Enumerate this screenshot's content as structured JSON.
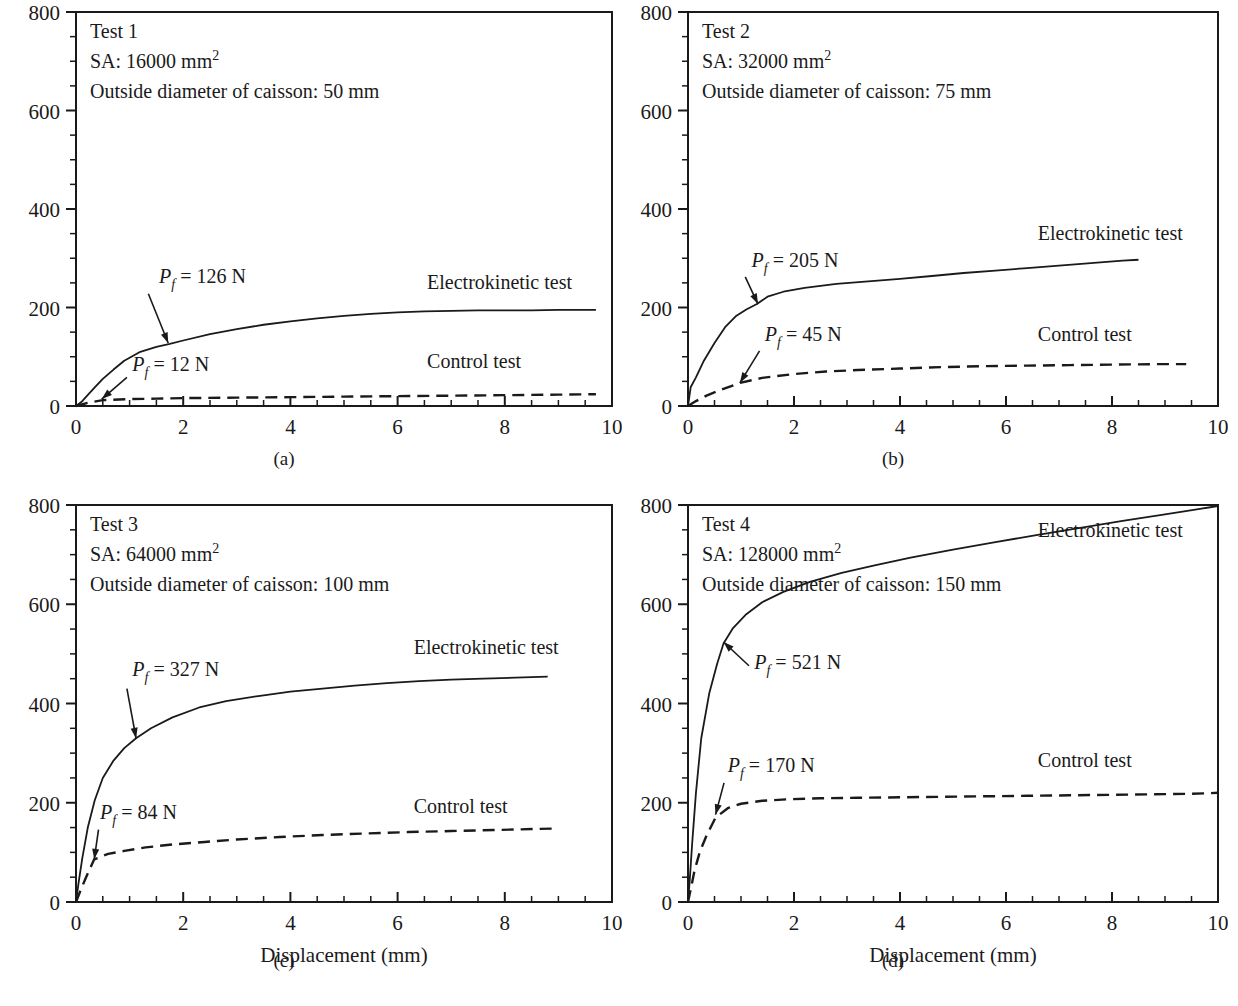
{
  "figure": {
    "axis_titles": {
      "x": "Displacement (mm)",
      "y_prefix": "P",
      "y_suffix": " (N)"
    },
    "x_ticks": [
      "0",
      "2",
      "4",
      "6",
      "8",
      "10"
    ],
    "y_ticks": [
      "0",
      "200",
      "400",
      "600",
      "800"
    ],
    "series_labels": {
      "electrokinetic": "Electrokinetic test",
      "control": "Control test"
    },
    "pf_prefix": "P",
    "pf_sub": "f",
    "pf_eq": " = "
  },
  "panels": [
    {
      "key": "a",
      "caption": "(a)",
      "test_label": "Test 1",
      "sa_label": "SA: 16000 mm",
      "sa_sup": "2",
      "diameter_label": "Outside diameter of caisson: 50 mm",
      "show_ylabel": true,
      "show_xlabel": false,
      "annotations": [
        {
          "name": "pf-electrokinetic",
          "value": "126 N",
          "text_x": 1.55,
          "text_y": 250,
          "tip_x": 1.72,
          "tip_y": 128,
          "tail_x": 1.35,
          "tail_y": 228
        },
        {
          "name": "pf-control",
          "value": "12 N",
          "text_x": 1.05,
          "text_y": 72,
          "tip_x": 0.48,
          "tip_y": 14,
          "tail_x": 0.95,
          "tail_y": 58
        }
      ],
      "labels": [
        {
          "name": "electrokinetic-label",
          "series": "electrokinetic",
          "x": 6.55,
          "y": 238
        },
        {
          "name": "control-label",
          "series": "control",
          "x": 6.55,
          "y": 78
        }
      ]
    },
    {
      "key": "b",
      "caption": "(b)",
      "test_label": "Test 2",
      "sa_label": "SA: 32000 mm",
      "sa_sup": "2",
      "diameter_label": "Outside diameter of caisson: 75 mm",
      "show_ylabel": false,
      "show_xlabel": false,
      "annotations": [
        {
          "name": "pf-electrokinetic",
          "value": "205 N",
          "text_x": 1.2,
          "text_y": 283,
          "tip_x": 1.32,
          "tip_y": 207,
          "tail_x": 1.08,
          "tail_y": 262
        },
        {
          "name": "pf-control",
          "value": "45 N",
          "text_x": 1.45,
          "text_y": 131,
          "tip_x": 0.98,
          "tip_y": 47,
          "tail_x": 1.35,
          "tail_y": 112
        }
      ],
      "labels": [
        {
          "name": "electrokinetic-label",
          "series": "electrokinetic",
          "x": 6.6,
          "y": 338
        },
        {
          "name": "control-label",
          "series": "control",
          "x": 6.6,
          "y": 132
        }
      ]
    },
    {
      "key": "c",
      "caption": "(c)",
      "test_label": "Test 3",
      "sa_label": "SA: 64000 mm",
      "sa_sup": "2",
      "diameter_label": "Outside diameter of caisson: 100 mm",
      "show_ylabel": true,
      "show_xlabel": true,
      "annotations": [
        {
          "name": "pf-electrokinetic",
          "value": "327 N",
          "text_x": 1.05,
          "text_y": 455,
          "tip_x": 1.12,
          "tip_y": 330,
          "tail_x": 0.95,
          "tail_y": 430
        },
        {
          "name": "pf-control",
          "value": "84 N",
          "text_x": 0.45,
          "text_y": 168,
          "tip_x": 0.34,
          "tip_y": 86,
          "tail_x": 0.42,
          "tail_y": 146
        }
      ],
      "labels": [
        {
          "name": "electrokinetic-label",
          "series": "electrokinetic",
          "x": 6.3,
          "y": 500
        },
        {
          "name": "control-label",
          "series": "control",
          "x": 6.3,
          "y": 180
        }
      ]
    },
    {
      "key": "d",
      "caption": "(d)",
      "test_label": "Test 4",
      "sa_label": "SA: 128000 mm",
      "sa_sup": "2",
      "diameter_label": "Outside diameter of caisson: 150 mm",
      "show_ylabel": false,
      "show_xlabel": true,
      "annotations": [
        {
          "name": "pf-electrokinetic",
          "value": "521 N",
          "text_x": 1.25,
          "text_y": 470,
          "tip_x": 0.67,
          "tip_y": 524,
          "tail_x": 1.15,
          "tail_y": 476
        },
        {
          "name": "pf-control",
          "value": "170 N",
          "text_x": 0.75,
          "text_y": 262,
          "tip_x": 0.52,
          "tip_y": 176,
          "tail_x": 0.68,
          "tail_y": 240
        }
      ],
      "labels": [
        {
          "name": "electrokinetic-label",
          "series": "electrokinetic",
          "x": 6.6,
          "y": 735
        },
        {
          "name": "control-label",
          "series": "control",
          "x": 6.6,
          "y": 272
        }
      ]
    }
  ],
  "chart_data": {
    "type": "line",
    "title": "",
    "xlabel": "Displacement (mm)",
    "ylabel": "P (N)",
    "xlim": [
      0,
      10
    ],
    "ylim": [
      0,
      800
    ],
    "xticks": [
      0,
      2,
      4,
      6,
      8,
      10
    ],
    "yticks": [
      0,
      200,
      400,
      600,
      800
    ],
    "xminor_step": 0.5,
    "yminor_step": 50,
    "grid": false,
    "legend": "inline-annotations",
    "panels": [
      {
        "panel": "a",
        "test": "Test 1",
        "surface_area_mm2": 16000,
        "caisson_outside_diameter_mm": 50,
        "Pf_electrokinetic_N": 126,
        "Pf_control_N": 12,
        "series": [
          {
            "name": "Electrokinetic test",
            "style": "solid",
            "x": [
              0,
              0.1,
              0.2,
              0.35,
              0.5,
              0.7,
              0.9,
              1.2,
              1.5,
              1.75,
              2.0,
              2.5,
              3.0,
              3.5,
              4.0,
              4.5,
              5.0,
              5.5,
              6.0,
              6.5,
              7.0,
              7.5,
              8.0,
              8.5,
              9.0,
              9.5,
              9.7
            ],
            "y": [
              0,
              8,
              20,
              38,
              55,
              74,
              92,
              110,
              120,
              126,
              133,
              146,
              156,
              165,
              172,
              178,
              183,
              187,
              190,
              192,
              193,
              194,
              194,
              194,
              195,
              195,
              195
            ]
          },
          {
            "name": "Control test",
            "style": "dashed",
            "x": [
              0,
              0.2,
              0.5,
              1.0,
              1.5,
              2.0,
              3.0,
              4.0,
              5.0,
              6.0,
              7.0,
              8.0,
              9.0,
              9.7
            ],
            "y": [
              0,
              6,
              12,
              14,
              15,
              16,
              17,
              18,
              19,
              20,
              21,
              22,
              23,
              24
            ]
          }
        ]
      },
      {
        "panel": "b",
        "test": "Test 2",
        "surface_area_mm2": 32000,
        "caisson_outside_diameter_mm": 75,
        "Pf_electrokinetic_N": 205,
        "Pf_control_N": 45,
        "series": [
          {
            "name": "Electrokinetic test",
            "style": "solid",
            "x": [
              0,
              0.05,
              0.15,
              0.3,
              0.5,
              0.7,
              0.9,
              1.1,
              1.3,
              1.5,
              1.8,
              2.2,
              2.8,
              3.4,
              4.0,
              4.6,
              5.2,
              5.8,
              6.4,
              7.0,
              7.6,
              8.2,
              8.5
            ],
            "y": [
              0,
              38,
              58,
              92,
              128,
              160,
              182,
              196,
              207,
              222,
              232,
              240,
              248,
              253,
              258,
              264,
              270,
              275,
              280,
              285,
              290,
              295,
              297
            ]
          },
          {
            "name": "Control test",
            "style": "dashed",
            "x": [
              0,
              0.15,
              0.35,
              0.6,
              0.98,
              1.4,
              2.0,
              2.6,
              3.2,
              4.0,
              4.8,
              5.6,
              6.4,
              7.2,
              8.0,
              8.8,
              9.4
            ],
            "y": [
              0,
              10,
              21,
              32,
              47,
              57,
              65,
              70,
              73,
              76,
              79,
              81,
              82,
              83,
              84,
              85,
              85
            ]
          }
        ]
      },
      {
        "panel": "c",
        "test": "Test 3",
        "surface_area_mm2": 64000,
        "caisson_outside_diameter_mm": 100,
        "Pf_electrokinetic_N": 327,
        "Pf_control_N": 84,
        "series": [
          {
            "name": "Electrokinetic test",
            "style": "solid",
            "x": [
              0,
              0.05,
              0.12,
              0.22,
              0.35,
              0.5,
              0.7,
              0.9,
              1.12,
              1.4,
              1.8,
              2.3,
              2.8,
              3.4,
              4.0,
              4.6,
              5.2,
              5.8,
              6.4,
              7.0,
              7.6,
              8.2,
              8.8
            ],
            "y": [
              0,
              40,
              90,
              150,
              205,
              250,
              285,
              310,
              330,
              350,
              372,
              392,
              405,
              415,
              424,
              430,
              436,
              441,
              445,
              448,
              450,
              452,
              454
            ]
          },
          {
            "name": "Control test",
            "style": "dashed",
            "x": [
              0,
              0.08,
              0.18,
              0.34,
              0.6,
              0.9,
              1.3,
              1.8,
              2.4,
              3.0,
              3.8,
              4.6,
              5.4,
              6.2,
              7.0,
              7.8,
              8.5,
              8.9
            ],
            "y": [
              0,
              22,
              48,
              86,
              97,
              103,
              110,
              116,
              121,
              126,
              131,
              135,
              138,
              141,
              143,
              145,
              147,
              148
            ]
          }
        ]
      },
      {
        "panel": "d",
        "test": "Test 4",
        "surface_area_mm2": 128000,
        "caisson_outside_diameter_mm": 150,
        "Pf_electrokinetic_N": 521,
        "Pf_control_N": 170,
        "series": [
          {
            "name": "Electrokinetic test",
            "style": "solid",
            "x": [
              0,
              0.03,
              0.08,
              0.15,
              0.25,
              0.4,
              0.55,
              0.67,
              0.85,
              1.1,
              1.4,
              1.8,
              2.3,
              2.9,
              3.5,
              4.2,
              5.0,
              5.8,
              6.6,
              7.4,
              8.2,
              9.0,
              9.6,
              10.0
            ],
            "y": [
              0,
              40,
              120,
              220,
              330,
              420,
              480,
              521,
              552,
              580,
              604,
              625,
              645,
              663,
              678,
              694,
              710,
              725,
              740,
              754,
              768,
              781,
              791,
              798
            ]
          },
          {
            "name": "Control test",
            "style": "dashed",
            "x": [
              0,
              0.05,
              0.12,
              0.22,
              0.35,
              0.52,
              0.75,
              1.0,
              1.4,
              1.9,
              2.5,
              3.2,
              4.0,
              4.8,
              5.6,
              6.4,
              7.2,
              8.0,
              8.8,
              9.5,
              10.0
            ],
            "y": [
              0,
              25,
              62,
              100,
              134,
              170,
              189,
              198,
              204,
              207,
              209,
              210,
              211,
              212,
              213,
              214,
              215,
              216,
              217,
              218,
              220
            ]
          }
        ]
      }
    ]
  }
}
